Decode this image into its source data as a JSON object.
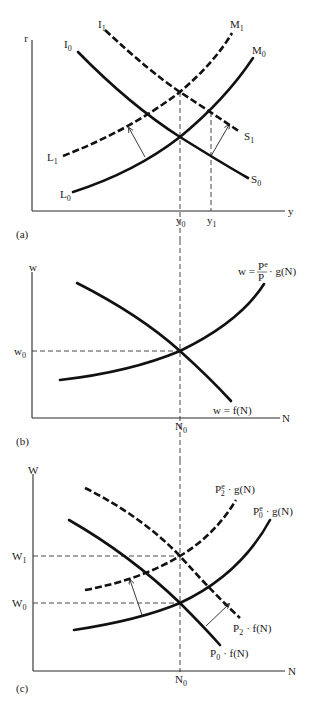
{
  "panels": [
    {
      "id": "a",
      "caption": "(a)",
      "y_axis_label": "r",
      "x_axis_label": "y",
      "x_ticks": [
        "y0",
        "y1"
      ],
      "curves": [
        {
          "label": "I0",
          "end_label": "S0",
          "style": "solid",
          "shape": "downward"
        },
        {
          "label": "I1",
          "end_label": "S1",
          "style": "dashed",
          "shape": "downward"
        },
        {
          "label": "L0",
          "end_label": "M0",
          "style": "solid",
          "shape": "upward"
        },
        {
          "label": "L1",
          "end_label": "M1",
          "style": "dashed",
          "shape": "upward"
        }
      ],
      "labels": {
        "r": "r",
        "y": "y",
        "y0": "y",
        "y0_sub": "0",
        "y1": "y",
        "y1_sub": "1",
        "I0": "I",
        "I0_sub": "0",
        "I1": "I",
        "I1_sub": "1",
        "M0": "M",
        "M0_sub": "0",
        "M1": "M",
        "M1_sub": "1",
        "L0": "L",
        "L0_sub": "0",
        "L1": "L",
        "L1_sub": "1",
        "S0": "S",
        "S0_sub": "0",
        "S1": "S",
        "S1_sub": "1"
      }
    },
    {
      "id": "b",
      "caption": "(b)",
      "y_axis_label": "w",
      "x_axis_label": "N",
      "labels": {
        "w": "w",
        "N": "N",
        "w0": "w",
        "w0_sub": "0",
        "N0": "N",
        "N0_sub": "0",
        "supply_prefix": "w =",
        "supply_num": "P",
        "supply_num_sup": "e",
        "supply_den": "P",
        "supply_suffix": "· g(N)",
        "demand": "w = f(N)"
      }
    },
    {
      "id": "c",
      "caption": "(c)",
      "y_axis_label": "W",
      "x_axis_label": "N",
      "labels": {
        "W": "W",
        "N": "N",
        "W0": "W",
        "W0_sub": "0",
        "W1": "W",
        "W1_sub": "1",
        "N0": "N",
        "N0_sub": "0",
        "P2e_g": "P",
        "P2e_sup": "e",
        "P2e_sub": "2",
        "P2e_suffix": "· g(N)",
        "P0e_g": "P",
        "P0e_sup": "e",
        "P0e_sub": "0",
        "P0e_suffix": "· g(N)",
        "P2_f": "P",
        "P2_f_sub": "2",
        "P2_f_suffix": "· f(N)",
        "P0_f": "P",
        "P0_f_sub": "0",
        "P0_f_suffix": "· f(N)"
      }
    }
  ]
}
